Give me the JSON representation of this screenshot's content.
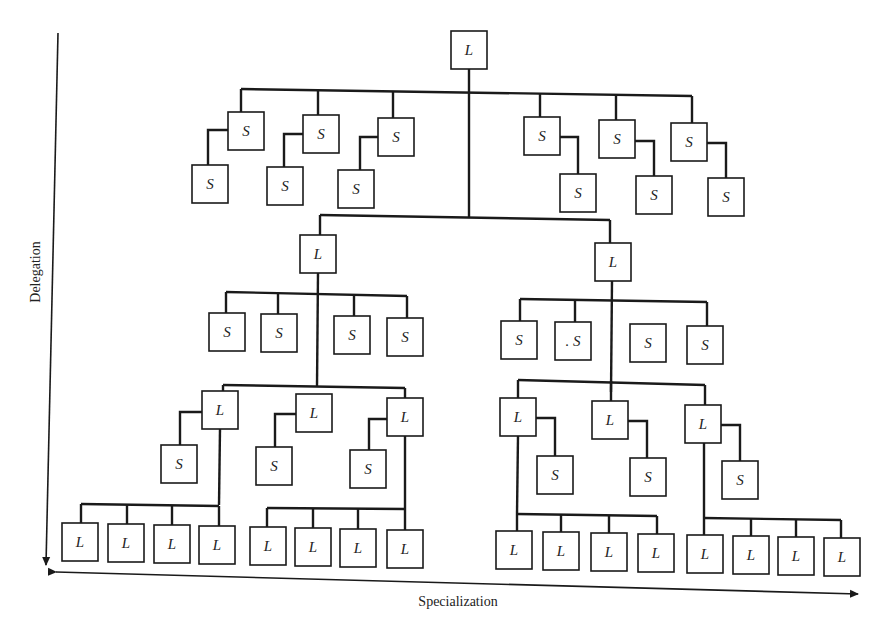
{
  "diagram": {
    "title": "",
    "axes": {
      "vertical_label": "Delegation",
      "horizontal_label": "Specialization"
    },
    "legend": {
      "L": "L",
      "S": "S"
    },
    "box_size": {
      "w": 36,
      "h": 38
    },
    "nodes": [
      {
        "id": "root",
        "label": "L",
        "x": 469,
        "y": 50
      },
      {
        "id": "s1",
        "label": "S",
        "x": 246,
        "y": 131
      },
      {
        "id": "s2",
        "label": "S",
        "x": 321,
        "y": 134
      },
      {
        "id": "s3",
        "label": "S",
        "x": 396,
        "y": 137
      },
      {
        "id": "s1c",
        "label": "S",
        "x": 210,
        "y": 184
      },
      {
        "id": "s2c",
        "label": "S",
        "x": 285,
        "y": 186
      },
      {
        "id": "s3c",
        "label": "S",
        "x": 356,
        "y": 189
      },
      {
        "id": "s4",
        "label": "S",
        "x": 542,
        "y": 136
      },
      {
        "id": "s5",
        "label": "S",
        "x": 617,
        "y": 139
      },
      {
        "id": "s6",
        "label": "S",
        "x": 689,
        "y": 142
      },
      {
        "id": "s4c",
        "label": "S",
        "x": 578,
        "y": 193
      },
      {
        "id": "s5c",
        "label": "S",
        "x": 654,
        "y": 195
      },
      {
        "id": "s6c",
        "label": "S",
        "x": 726,
        "y": 197
      },
      {
        "id": "L1",
        "label": "L",
        "x": 318,
        "y": 254
      },
      {
        "id": "L2",
        "label": "L",
        "x": 613,
        "y": 262
      },
      {
        "id": "l1s1",
        "label": "S",
        "x": 227,
        "y": 332
      },
      {
        "id": "l1s2",
        "label": "S",
        "x": 279,
        "y": 333
      },
      {
        "id": "l1s3",
        "label": "S",
        "x": 352,
        "y": 335
      },
      {
        "id": "l1s4",
        "label": "S",
        "x": 405,
        "y": 337
      },
      {
        "id": "l2s1",
        "label": "S",
        "x": 519,
        "y": 340
      },
      {
        "id": "l2s2",
        "label": ". S",
        "x": 573,
        "y": 341
      },
      {
        "id": "l2s3",
        "label": "S",
        "x": 648,
        "y": 343
      },
      {
        "id": "l2s4",
        "label": "S",
        "x": 705,
        "y": 345
      },
      {
        "id": "L11",
        "label": "L",
        "x": 220,
        "y": 410
      },
      {
        "id": "L12",
        "label": "L",
        "x": 314,
        "y": 413
      },
      {
        "id": "L13",
        "label": "L",
        "x": 405,
        "y": 417
      },
      {
        "id": "L11s",
        "label": "S",
        "x": 179,
        "y": 464
      },
      {
        "id": "L12s",
        "label": "S",
        "x": 274,
        "y": 466
      },
      {
        "id": "L13s",
        "label": "S",
        "x": 368,
        "y": 469
      },
      {
        "id": "L21",
        "label": "L",
        "x": 518,
        "y": 417
      },
      {
        "id": "L22",
        "label": "L",
        "x": 610,
        "y": 420
      },
      {
        "id": "L23",
        "label": "L",
        "x": 703,
        "y": 424
      },
      {
        "id": "L21s",
        "label": "S",
        "x": 555,
        "y": 475
      },
      {
        "id": "L22s",
        "label": "S",
        "x": 648,
        "y": 477
      },
      {
        "id": "L23s",
        "label": "S",
        "x": 740,
        "y": 480
      },
      {
        "id": "b1",
        "label": "L",
        "x": 80,
        "y": 542
      },
      {
        "id": "b2",
        "label": "L",
        "x": 126,
        "y": 543
      },
      {
        "id": "b3",
        "label": "L",
        "x": 172,
        "y": 544
      },
      {
        "id": "b4",
        "label": "L",
        "x": 217,
        "y": 545
      },
      {
        "id": "b5",
        "label": "L",
        "x": 268,
        "y": 546
      },
      {
        "id": "b6",
        "label": "L",
        "x": 313,
        "y": 547
      },
      {
        "id": "b7",
        "label": "L",
        "x": 358,
        "y": 548
      },
      {
        "id": "b8",
        "label": "L",
        "x": 405,
        "y": 549
      },
      {
        "id": "b9",
        "label": "L",
        "x": 514,
        "y": 550
      },
      {
        "id": "b10",
        "label": "L",
        "x": 561,
        "y": 551
      },
      {
        "id": "b11",
        "label": "L",
        "x": 609,
        "y": 552
      },
      {
        "id": "b12",
        "label": "L",
        "x": 656,
        "y": 553
      },
      {
        "id": "b13",
        "label": "L",
        "x": 705,
        "y": 554
      },
      {
        "id": "b14",
        "label": "L",
        "x": 751,
        "y": 555
      },
      {
        "id": "b15",
        "label": "L",
        "x": 796,
        "y": 556
      },
      {
        "id": "b16",
        "label": "L",
        "x": 842,
        "y": 557
      }
    ],
    "edges": [
      "M469,69 L469,218",
      "M241,89 L692,96",
      "M241,89 L241,112",
      "M318,90 L318,115",
      "M393,91 L393,118",
      "M540,93 L540,117",
      "M616,94 L616,120",
      "M692,96 L692,123",
      "M228,130 L208,130 L208,165",
      "M303,134 L284,134 L284,167",
      "M378,137 L360,137 L360,170",
      "M560,137 L578,137 L578,174",
      "M635,141 L654,141 L654,176",
      "M707,143 L726,143 L726,178",
      "M320,215 L610,220",
      "M320,215 L320,235",
      "M610,220 L610,243",
      "M226,292 L407,296",
      "M226,292 L226,313",
      "M278,293 L278,314",
      "M354,294 L354,316",
      "M407,296 L407,318",
      "M318,273 L317,386",
      "M520,299 L707,302",
      "M520,299 L520,321",
      "M575,300 L575,322",
      "M707,302 L707,326",
      "M612,281 L611,392",
      "M223,385 L405,388",
      "M223,385 L223,391",
      "M405,388 L405,398",
      "M202,412 L180,412 L180,445",
      "M296,414 L275,414 L275,447",
      "M387,419 L369,419 L369,450",
      "M220,429 L219,505",
      "M81,504 L219,506",
      "M81,504 L81,523",
      "M127,505 L127,524",
      "M172,505 L172,525",
      "M219,506 L219,526",
      "M405,436 L405,509",
      "M267,508 L405,509",
      "M267,508 L267,527",
      "M313,508 L313,528",
      "M358,509 L358,529",
      "M405,509 L405,530",
      "M518,380 L705,385",
      "M518,380 L518,398",
      "M611,381 L611,401",
      "M705,385 L705,405",
      "M536,418 L555,418 L555,456",
      "M628,421 L647,421 L647,458",
      "M721,425 L740,425 L740,461",
      "M518,436 L517,514",
      "M517,514 L657,516",
      "M561,514 L561,532",
      "M609,515 L609,533",
      "M657,516 L657,534",
      "M517,514 L517,531",
      "M704,443 L704,518",
      "M704,518 L841,520",
      "M704,518 L704,535",
      "M751,518 L751,536",
      "M796,519 L796,537",
      "M841,520 L841,538"
    ],
    "vertical_arrow": {
      "x1": 58,
      "y1": 33,
      "x2": 46,
      "y2": 565
    },
    "horizontal_arrow": {
      "x1": 56,
      "y1": 572,
      "x2": 858,
      "y2": 594
    }
  }
}
